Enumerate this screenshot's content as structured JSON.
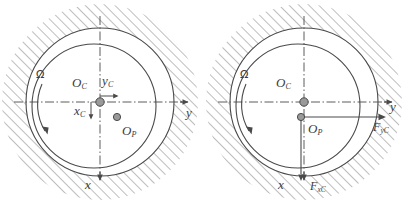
{
  "figure": {
    "type": "technical-diagram",
    "background_color": "#ffffff",
    "line_color": "#4a4a4a",
    "hatch_color": "#8d8d8d",
    "node_fill_color": "#9a9a9a"
  },
  "panels": [
    {
      "id": "left",
      "name": "journal-bearing-kinematics",
      "labels": {
        "omega": "Ω",
        "center_journal": "O",
        "center_journal_sub": "C",
        "center_pressure": "O",
        "center_pressure_sub": "P",
        "axis_y_global": "y",
        "axis_x_global": "x",
        "axis_y_local": "y",
        "axis_y_local_sub": "C",
        "axis_x_local": "x",
        "axis_x_local_sub": "C"
      },
      "geometry": {
        "bearing_circle": {
          "cx": 100,
          "cy": 102,
          "r": 74
        },
        "journal_circle": {
          "cx": 94,
          "cy": 106,
          "r": 62
        },
        "node_center": {
          "cx": 100,
          "cy": 102,
          "r": 4.2
        },
        "node_pressure": {
          "cx": 117,
          "cy": 117,
          "r": 3.6
        }
      }
    },
    {
      "id": "right",
      "name": "journal-bearing-forces",
      "labels": {
        "omega": "Ω",
        "center_journal": "O",
        "center_journal_sub": "C",
        "center_pressure": "O",
        "center_pressure_sub": "P",
        "axis_y_global": "y",
        "axis_x_global": "x",
        "force_y": "F",
        "force_y_sub": "yC",
        "force_x": "F",
        "force_x_sub": "xC"
      },
      "geometry": {
        "bearing_circle": {
          "cx": 100,
          "cy": 102,
          "r": 74
        },
        "journal_circle": {
          "cx": 94,
          "cy": 106,
          "r": 62
        },
        "node_center": {
          "cx": 100,
          "cy": 102,
          "r": 4.2
        },
        "node_pressure": {
          "cx": 97,
          "cy": 117,
          "r": 3.6
        }
      }
    }
  ]
}
